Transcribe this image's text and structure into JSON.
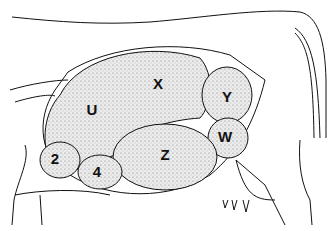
{
  "diagram": {
    "labels": [
      {
        "id": "U",
        "text": "U",
        "x": 92,
        "y": 109
      },
      {
        "id": "X",
        "text": "X",
        "x": 158,
        "y": 83
      },
      {
        "id": "Y",
        "text": "Y",
        "x": 227,
        "y": 96
      },
      {
        "id": "W",
        "text": "W",
        "x": 225,
        "y": 136
      },
      {
        "id": "Z",
        "text": "Z",
        "x": 165,
        "y": 154
      },
      {
        "id": "2",
        "text": "2",
        "x": 55,
        "y": 158
      },
      {
        "id": "4",
        "text": "4",
        "x": 97,
        "y": 171
      }
    ],
    "colors": {
      "outline": "#111111",
      "stipple_fill": "#d9d9d9",
      "background": "#ffffff"
    }
  }
}
